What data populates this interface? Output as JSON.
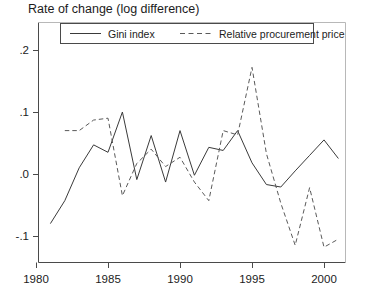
{
  "chart_data": {
    "type": "line",
    "title": "Rate of change (log difference)",
    "xlabel": "",
    "ylabel": "",
    "xlim": [
      1980,
      2002
    ],
    "ylim": [
      -0.135,
      0.225
    ],
    "grid": false,
    "legend_position": "top-inside",
    "xticks": [
      1980,
      1985,
      1990,
      1995,
      2000
    ],
    "xtick_labels": [
      "1980",
      "1985",
      "1990",
      "1995",
      "2000"
    ],
    "yticks": [
      -0.1,
      0.0,
      0.1,
      0.2
    ],
    "ytick_labels": [
      "-.1",
      ".0",
      ".1",
      ".2"
    ],
    "series": [
      {
        "name": "Gini index",
        "style": "solid",
        "color": "#3a3a3a",
        "x": [
          1981,
          1982,
          1983,
          1984,
          1985,
          1986,
          1987,
          1988,
          1989,
          1990,
          1991,
          1992,
          1993,
          1994,
          1995,
          1996,
          1997,
          1998,
          1999,
          2000,
          2001
        ],
        "values": [
          -0.08,
          -0.043,
          0.01,
          0.047,
          0.035,
          0.1,
          -0.009,
          0.062,
          -0.013,
          0.07,
          -0.002,
          0.043,
          0.038,
          0.07,
          0.018,
          -0.017,
          -0.021,
          0.005,
          0.03,
          0.055,
          0.025
        ]
      },
      {
        "name": "Relative procurement price",
        "style": "dashed",
        "color": "#5a5a5a",
        "x": [
          1982,
          1983,
          1984,
          1985,
          1986,
          1987,
          1988,
          1989,
          1990,
          1991,
          1992,
          1993,
          1994,
          1995,
          1996,
          1997,
          1998,
          1999,
          2000,
          2001
        ],
        "values": [
          0.07,
          0.07,
          0.087,
          0.09,
          -0.035,
          0.017,
          0.04,
          0.012,
          0.027,
          -0.013,
          -0.043,
          0.07,
          0.063,
          0.172,
          0.033,
          -0.047,
          -0.115,
          -0.022,
          -0.118,
          -0.105
        ]
      }
    ]
  },
  "legend": {
    "entries": [
      {
        "label": "Gini index",
        "style": "solid"
      },
      {
        "label": "Relative procurement price",
        "style": "dashed"
      }
    ]
  }
}
